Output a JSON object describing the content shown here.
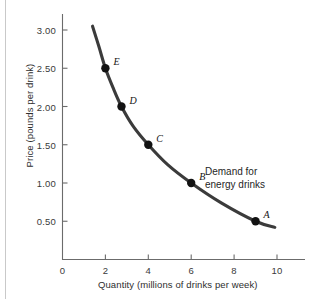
{
  "chart_data": {
    "type": "line",
    "title": "",
    "xlabel": "Quantity (millions of drinks per week)",
    "ylabel": "Price (pounds per drink)",
    "xlim": [
      0,
      11
    ],
    "ylim": [
      0,
      3.25
    ],
    "grid": false,
    "legend_position": "inline-annotation",
    "annotations": [
      {
        "name": "demand-curve-label",
        "line1": "Demand for",
        "line2": "energy drinks",
        "x": 7.4,
        "y": 1.2
      }
    ],
    "xticks": [
      {
        "value": 0,
        "label": "0"
      },
      {
        "value": 2,
        "label": "2"
      },
      {
        "value": 4,
        "label": "4"
      },
      {
        "value": 6,
        "label": "6"
      },
      {
        "value": 8,
        "label": "8"
      },
      {
        "value": 10,
        "label": "10"
      }
    ],
    "yticks": [
      {
        "value": 0.5,
        "label": "0.50"
      },
      {
        "value": 1.0,
        "label": "1.00"
      },
      {
        "value": 1.5,
        "label": "1.50"
      },
      {
        "value": 2.0,
        "label": "2.00"
      },
      {
        "value": 2.5,
        "label": "2.50"
      },
      {
        "value": 3.0,
        "label": "3.00"
      }
    ],
    "series": [
      {
        "name": "Demand for energy drinks",
        "color": "#3b3b3b",
        "x": [
          1.4,
          1.7,
          2.0,
          2.35,
          2.75,
          3.3,
          4.0,
          4.9,
          6.0,
          7.4,
          9.0,
          9.9
        ],
        "y": [
          3.05,
          2.78,
          2.5,
          2.25,
          2.0,
          1.74,
          1.5,
          1.24,
          1.0,
          0.74,
          0.5,
          0.42
        ]
      }
    ],
    "points": [
      {
        "label": "A",
        "x": 9.0,
        "y": 0.5,
        "label_dx": 8,
        "label_dy": -12
      },
      {
        "label": "B",
        "x": 6.0,
        "y": 1.0,
        "label_dx": 8,
        "label_dy": -12
      },
      {
        "label": "C",
        "x": 4.0,
        "y": 1.5,
        "label_dx": 8,
        "label_dy": -12
      },
      {
        "label": "D",
        "x": 2.75,
        "y": 2.0,
        "label_dx": 8,
        "label_dy": -12
      },
      {
        "label": "E",
        "x": 2.0,
        "y": 2.5,
        "label_dx": 8,
        "label_dy": -12
      }
    ]
  },
  "colors": {
    "curve": "#3b3b3b",
    "point": "#121212",
    "axis": "#6b6b6b",
    "text": "#2e2e2e",
    "background": "#ffffff",
    "left_rule": "#c9c9c9"
  }
}
